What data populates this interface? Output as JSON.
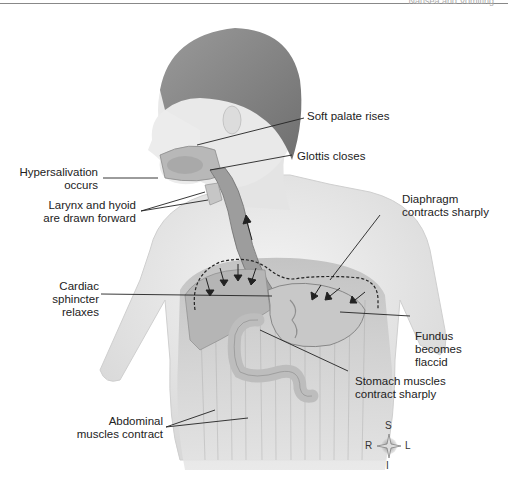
{
  "header": {
    "running_title": "Nausea and Vomiting"
  },
  "figure": {
    "labels": {
      "soft_palate": [
        "Soft palate rises"
      ],
      "glottis": [
        "Glottis closes"
      ],
      "hypersalivation": [
        "Hypersalivation",
        "occurs"
      ],
      "larynx": [
        "Larynx and hyoid",
        "are drawn forward"
      ],
      "diaphragm": [
        "Diaphragm",
        "contracts sharply"
      ],
      "cardiac_sphincter": [
        "Cardiac",
        "sphincter",
        "relaxes"
      ],
      "fundus": [
        "Fundus",
        "becomes",
        "flaccid"
      ],
      "stomach_muscles": [
        "Stomach muscles",
        "contract sharply"
      ],
      "abdominal": [
        "Abdominal",
        "muscles contract"
      ]
    },
    "orientation": {
      "superior": "S",
      "inferior": "I",
      "right": "R",
      "left": "L"
    }
  },
  "colors": {
    "ink": "#222222",
    "skin": "#e8e8e8",
    "hair": "#8a8a8a",
    "organ": "#bdbdbd"
  }
}
